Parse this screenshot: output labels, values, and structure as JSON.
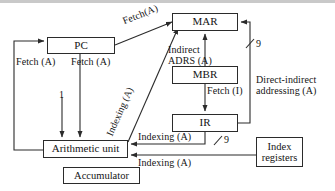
{
  "nodes": {
    "pc": "PC",
    "mar": "MAR",
    "mbr": "MBR",
    "ir": "IR",
    "arithmetic_unit": "Arithmetic unit",
    "index_registers": "Index\nregisters",
    "accumulator": "Accumulator"
  },
  "edge_labels": {
    "fetch_a_top": "Fetch(A)",
    "fetch_a_left": "Fetch (A)",
    "fetch_a_right": "Fetch (A)",
    "indexing_a_diagonal": "Indexing (A)",
    "indirect_adrs_a": "Indirect\nADRS (A)",
    "fetch_i": "Fetch (I)",
    "direct_indirect": "Direct-indirect\naddressing (A)",
    "indexing_a_mid": "Indexing (A)",
    "indexing_a_bottom": "Indexing (A)",
    "bus_width_top": "9",
    "bus_width_bottom": "9",
    "increment_one": "1"
  },
  "colors": {
    "stroke": "#2b2b2b",
    "text": "#141414",
    "background": "#ffffff",
    "rule": "#c9c9c9"
  }
}
